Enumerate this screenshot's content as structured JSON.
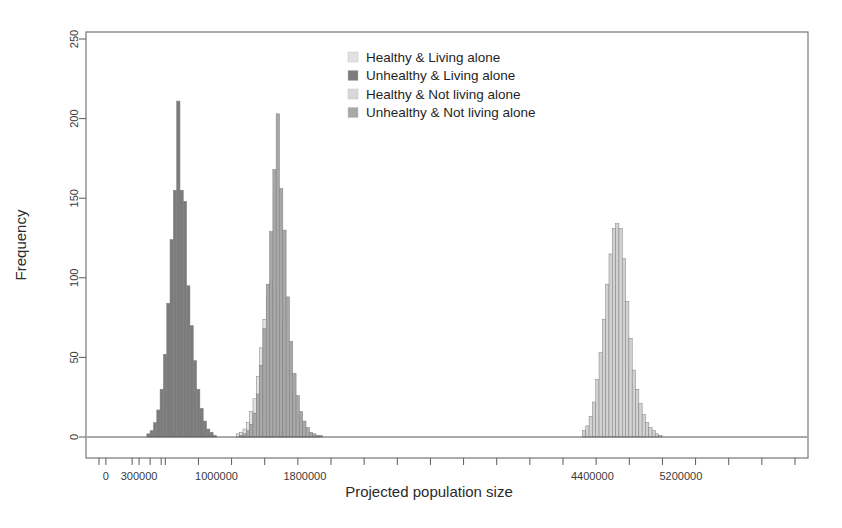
{
  "chart_data": {
    "type": "bar",
    "title": "",
    "subtitle": "",
    "xlabel": "Projected population size",
    "ylabel": "Frequency",
    "grid": false,
    "legend_position": "top-center-right",
    "xlim": [
      -180000,
      6350000
    ],
    "ylim": [
      0,
      262
    ],
    "x_tick_labels": [
      "0",
      "300000",
      "1000000",
      "1800000",
      "4400000",
      "5200000"
    ],
    "x_tick_values": [
      0,
      300000,
      1000000,
      1800000,
      4400000,
      5200000
    ],
    "x_minor_tick_values": [
      0,
      200000,
      300000,
      400000,
      500000,
      700000,
      1000000,
      1200000,
      1400000,
      1600000,
      1800000,
      2000000,
      2200000,
      2400000,
      2600000,
      2800000,
      3000000,
      3200000,
      3400000,
      3600000,
      3800000,
      4000000,
      4200000,
      4400000,
      4600000,
      4800000,
      5000000,
      5200000,
      5400000,
      5600000,
      5800000,
      6000000
    ],
    "y_tick_labels": [
      "0",
      "50",
      "100",
      "150",
      "200",
      "250"
    ],
    "y_tick_values": [
      0,
      50,
      100,
      150,
      200,
      250
    ],
    "bin_width": 30000,
    "series": [
      {
        "name": "Healthy & Living alone",
        "color": "#e2e2e2",
        "bins_start": 1180000,
        "values": [
          2,
          3,
          5,
          9,
          16,
          24,
          38,
          56,
          74,
          88,
          97,
          92,
          83,
          70,
          55,
          42,
          30,
          20,
          13,
          8,
          5,
          3,
          2,
          1,
          1
        ]
      },
      {
        "name": "Unhealthy & Living alone",
        "color": "#7c7c7c",
        "bins_start": 370000,
        "values": [
          2,
          4,
          9,
          17,
          30,
          52,
          84,
          124,
          155,
          211,
          155,
          148,
          95,
          70,
          48,
          30,
          18,
          10,
          5,
          3,
          1
        ]
      },
      {
        "name": "Healthy & Not living alone",
        "color": "#d2d2d2",
        "bins_start": 4310000,
        "values": [
          4,
          7,
          13,
          22,
          36,
          53,
          74,
          96,
          115,
          131,
          134,
          131,
          112,
          85,
          62,
          42,
          30,
          21,
          14,
          9,
          6,
          4,
          2,
          1
        ]
      },
      {
        "name": "Unhealthy & Not living alone",
        "color": "#a8a8a8",
        "bins_start": 1210000,
        "values": [
          1,
          2,
          4,
          8,
          15,
          27,
          45,
          68,
          96,
          129,
          168,
          203,
          156,
          130,
          88,
          60,
          40,
          26,
          16,
          10,
          6,
          3,
          2,
          1,
          1
        ]
      }
    ]
  },
  "legend": {
    "items": [
      {
        "label": "Healthy & Living alone",
        "swatch": "#e2e2e2"
      },
      {
        "label": "Unhealthy & Living alone",
        "swatch": "#7c7c7c"
      },
      {
        "label": "Healthy & Not living alone",
        "swatch": "#d8d8d8"
      },
      {
        "label": "Unhealthy & Not living alone",
        "swatch": "#a8a8a8"
      }
    ]
  },
  "axes": {
    "x_title": "Projected population size",
    "y_title": "Frequency"
  }
}
